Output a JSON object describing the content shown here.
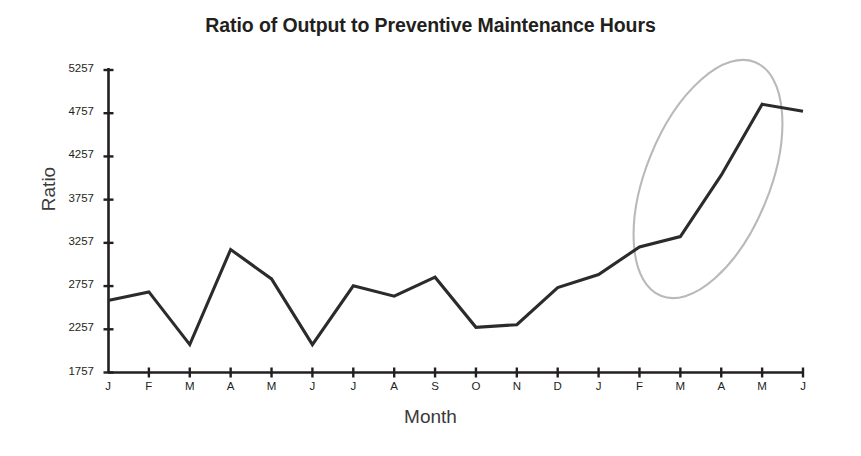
{
  "chart_data": {
    "type": "line",
    "title": "Ratio of Output to Preventive Maintenance Hours",
    "xlabel": "Month",
    "ylabel": "Ratio",
    "categories": [
      "J",
      "F",
      "M",
      "A",
      "M",
      "J",
      "J",
      "A",
      "S",
      "O",
      "N",
      "D",
      "J",
      "F",
      "M",
      "A",
      "M",
      "J"
    ],
    "values": [
      2590,
      2690,
      2080,
      3180,
      2840,
      2080,
      2760,
      2640,
      2860,
      2280,
      2310,
      2740,
      2890,
      3210,
      3330,
      4040,
      4860,
      4780
    ],
    "series": [
      {
        "name": "Ratio of Output to Preventive Maintenance Hours",
        "values": [
          2590,
          2690,
          2080,
          3180,
          2840,
          2080,
          2760,
          2640,
          2860,
          2280,
          2310,
          2740,
          2890,
          3210,
          3330,
          4040,
          4860,
          4780
        ],
        "color": "#2b2b2b"
      }
    ],
    "ylim": [
      1757,
      5257
    ],
    "yticks": [
      1757,
      2257,
      2757,
      3257,
      3757,
      4257,
      4757,
      5257
    ],
    "ytick_labels": [
      "1757",
      "2257",
      "2757",
      "3257",
      "3757",
      "4257",
      "4757",
      "5257"
    ],
    "grid": false,
    "legend": "none",
    "annotations": [
      {
        "type": "ellipse",
        "name": "trend-highlight-ellipse",
        "color": "#b9b9b9",
        "description": "hand-drawn oval circling the rising trend over the final six months",
        "covers_categories": [
          "D",
          "J",
          "F",
          "M",
          "A",
          "M",
          "J"
        ]
      }
    ]
  },
  "colors": {
    "line": "#2b2b2b",
    "axis": "#231f20",
    "annotation": "#b9b9b9",
    "title": "#231f20",
    "background": "#ffffff"
  }
}
